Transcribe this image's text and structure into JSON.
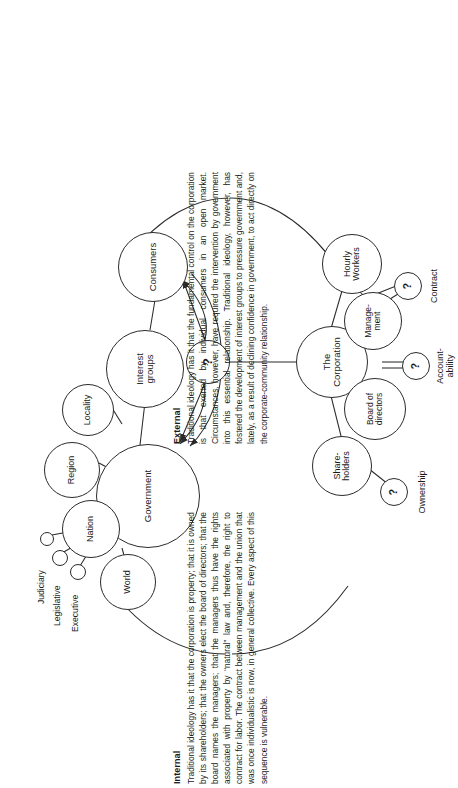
{
  "figure": {
    "center_node": {
      "label": "?",
      "name": "unknown-center"
    },
    "external": {
      "heading": "External",
      "body": "Traditional ideology has it that the fundamental control on the corporation is that exerted by individual consumers in an open market. Circumstances, however, have required the intervention by government into this essential relationship. Traditional ideology, however, has fostered the development of interest groups to pressure government and, lately, as a result of declining confidence in government, to act directly on the corporate-community relationship.",
      "nodes": [
        {
          "id": "government",
          "label": "Government",
          "kind": "primary"
        },
        {
          "id": "interest",
          "label": "Interest\ngroups",
          "kind": "primary"
        },
        {
          "id": "consumers",
          "label": "Consumers",
          "kind": "primary"
        },
        {
          "id": "world",
          "label": "World",
          "kind": "secondary"
        },
        {
          "id": "nation",
          "label": "Nation",
          "kind": "secondary"
        },
        {
          "id": "region",
          "label": "Region",
          "kind": "secondary"
        },
        {
          "id": "locality",
          "label": "Locality",
          "kind": "secondary"
        }
      ],
      "branch_labels": [
        {
          "id": "executive",
          "label": "Executive"
        },
        {
          "id": "legislative",
          "label": "Legislative"
        },
        {
          "id": "judiciary",
          "label": "Judiciary"
        }
      ]
    },
    "internal": {
      "heading": "Internal",
      "body": "Traditional ideology has it that the corporation is property; that it is owned by its shareholders; that the owners elect the board of directors; that the board names the managers; that the managers thus have the rights associated with property by “natural” law and, therefore, the right to contract for labor. The contract between management and the union that was once individualistic is now, in general collective. Every aspect of this sequence is vulnerable.",
      "nodes": [
        {
          "id": "corporation",
          "label": "The\nCorporation",
          "kind": "primary"
        },
        {
          "id": "shareholders",
          "label": "Share-\nholders",
          "kind": "secondary"
        },
        {
          "id": "board",
          "label": "Board of\ndirectors",
          "kind": "secondary"
        },
        {
          "id": "management",
          "label": "Manage-\nment",
          "kind": "secondary"
        },
        {
          "id": "hourly",
          "label": "Hourly\nWorkers",
          "kind": "secondary"
        }
      ],
      "question_nodes": [
        {
          "id": "ownership",
          "mark": "?",
          "label": "Ownership"
        },
        {
          "id": "accountability",
          "mark": "?",
          "label": "Account-\nability"
        },
        {
          "id": "contract",
          "mark": "?",
          "label": "Contract"
        }
      ]
    },
    "colors": {
      "stroke": "#2b2b2b",
      "text": "#1a1a1a",
      "background": "#ffffff"
    }
  }
}
